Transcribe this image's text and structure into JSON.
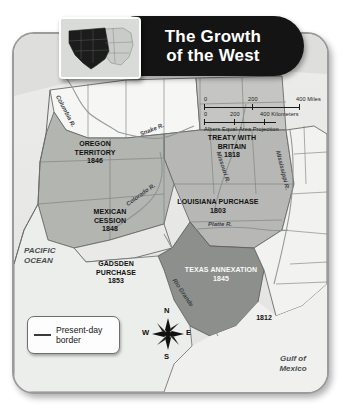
{
  "title": {
    "line1": "The Growth",
    "line2": "of the West",
    "full": "The Growth of the West"
  },
  "inset": {
    "name": "united-states-locator-map",
    "description": "United States locator map with western territories shaded dark"
  },
  "scale": {
    "miles": {
      "zero": "0",
      "mid": "200",
      "max": "400 Miles"
    },
    "kilometers": {
      "zero": "0",
      "mid": "200",
      "max": "400 Kilometers"
    },
    "projection": "Albers Equal-Area Projection"
  },
  "legend": {
    "label": "Present-day\nborder"
  },
  "compass": {
    "north": "N",
    "south": "S",
    "east": "E",
    "west": "W"
  },
  "territories": [
    {
      "name": "OREGON\nTERRITORY\n1846",
      "id": "oregon-territory"
    },
    {
      "name": "TREATY WITH\nBRITAIN\n1818",
      "id": "treaty-with-britain"
    },
    {
      "name": "LOUISIANA PURCHASE\n1803",
      "id": "louisiana-purchase"
    },
    {
      "name": "MEXICAN\nCESSION\n1848",
      "id": "mexican-cession"
    },
    {
      "name": "GADSDEN\nPURCHASE\n1853",
      "id": "gadsden-purchase"
    },
    {
      "name": "TEXAS ANNEXATION\n1845",
      "id": "texas-annexation"
    }
  ],
  "labels": {
    "oregon": "OREGON\nTERRITORY\n1846",
    "treaty_britain": "TREATY WITH\nBRITAIN\n1818",
    "louisiana": "LOUISIANA PURCHASE\n1803",
    "mexican_cession": "MEXICAN\nCESSION\n1848",
    "gadsden": "GADSDEN\nPURCHASE\n1853",
    "texas": "TEXAS ANNEXATION\n1845",
    "year_1812": "1812",
    "pacific_ocean": "PACIFIC\nOCEAN",
    "gulf_of_mexico": "Gulf of\nMexico"
  },
  "rivers": {
    "columbia": "Columbia R.",
    "snake": "Snake R.",
    "colorado": "Colorado R.",
    "missouri": "Missouri R.",
    "mississippi": "Mississippi R.",
    "platte": "Platte R.",
    "rio_grande": "Rio Grande"
  },
  "colors": {
    "title_pill": "#141414",
    "title_text": "#ffffff",
    "frame_bg": "#e9e9e7",
    "frame_border": "#9b9b9b",
    "land_light": "#f4f4f2",
    "land_medium": "#b9bab7",
    "land_dark": "#8f918e",
    "water": "#e4e5e3",
    "border_line": "#6a6c69"
  }
}
